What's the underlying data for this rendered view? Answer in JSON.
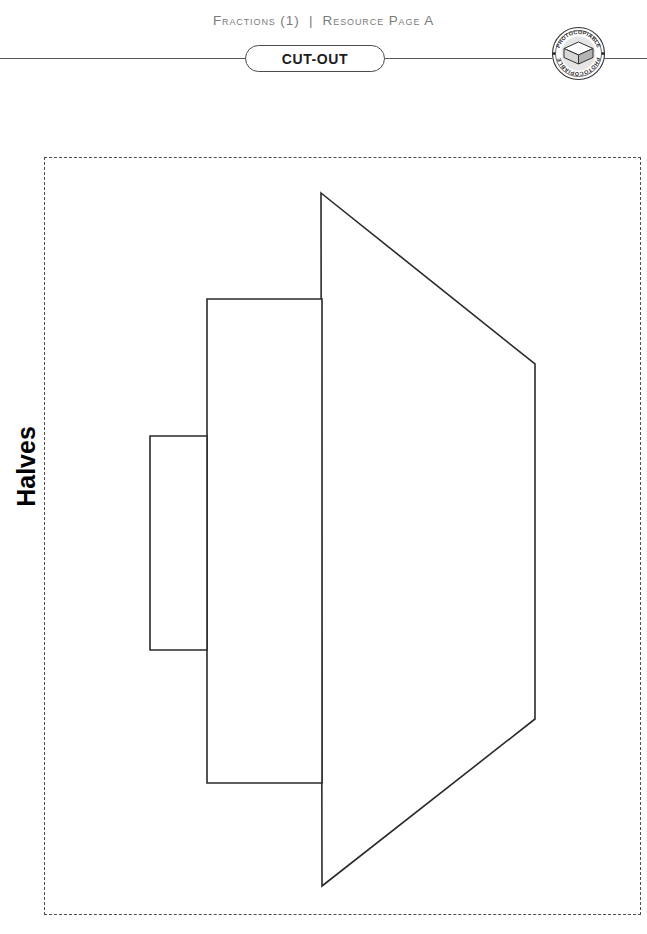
{
  "header": {
    "title": "Fractions (1)  |  Resource Page A"
  },
  "cutout": {
    "label": "CUT-OUT"
  },
  "stamp": {
    "text_top": "PHOTOCOPIABLE",
    "text_bottom": "PHOTOCOPIABLE",
    "icon": "paper-stack-icon"
  },
  "side_label": {
    "text": "Halves"
  },
  "colors": {
    "rule": "#5a5a5a",
    "header_text": "#7b7b7b",
    "dashed_border": "#4d4d52",
    "shape_stroke": "#2a2a2e",
    "badge_border": "#4a4a4a",
    "page_background": "#ffffff"
  },
  "cut_area": {
    "x": 44,
    "y": 157,
    "width": 597,
    "height": 758,
    "border_style": "dashed"
  },
  "shapes": [
    {
      "name": "small-rectangle",
      "type": "rect",
      "points": "150,436 207,436 207,650 150,650",
      "fraction_part": "smallest"
    },
    {
      "name": "medium-rectangle",
      "type": "rect",
      "points": "207,299 322,299 322,783 207,783",
      "fraction_part": "middle"
    },
    {
      "name": "large-trapezoid",
      "type": "polygon",
      "points": "321,193 535,364 535,719 322,886",
      "fraction_part": "largest"
    }
  ]
}
